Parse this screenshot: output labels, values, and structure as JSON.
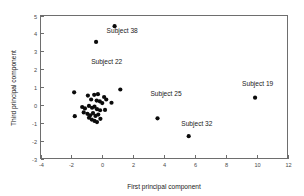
{
  "chart_data": {
    "type": "scatter",
    "title": "",
    "xlabel": "First principal component",
    "ylabel": "Third principal component",
    "xlim": [
      -4,
      12
    ],
    "ylim": [
      -3,
      5
    ],
    "xticks": [
      -4,
      -2,
      0,
      2,
      4,
      6,
      8,
      10,
      12
    ],
    "yticks": [
      -3,
      -2,
      -1,
      0,
      1,
      2,
      3,
      4,
      5
    ],
    "xtick_labels": [
      "-4",
      "-2",
      "0",
      "2",
      "4",
      "6",
      "8",
      "10",
      "12"
    ],
    "ytick_labels": [
      "-3",
      "-2",
      "-1",
      "0",
      "1",
      "2",
      "3",
      "4",
      "5"
    ],
    "grid": false,
    "legend": "none",
    "marker": "filled-circle",
    "marker_color": "#0b0b0b",
    "points": [
      {
        "x": 0.8,
        "y": 4.4
      },
      {
        "x": -0.4,
        "y": 3.52
      },
      {
        "x": 9.9,
        "y": 0.4
      },
      {
        "x": 3.58,
        "y": -0.75
      },
      {
        "x": 5.6,
        "y": -1.75
      },
      {
        "x": -1.82,
        "y": 0.7
      },
      {
        "x": 1.17,
        "y": 0.86
      },
      {
        "x": -0.93,
        "y": 0.52
      },
      {
        "x": -0.52,
        "y": 0.56
      },
      {
        "x": -0.28,
        "y": 0.6
      },
      {
        "x": 0.12,
        "y": 0.44
      },
      {
        "x": 0.26,
        "y": 0.3
      },
      {
        "x": 0.6,
        "y": 0.12
      },
      {
        "x": -0.72,
        "y": 0.3
      },
      {
        "x": -0.36,
        "y": 0.24
      },
      {
        "x": -0.16,
        "y": 0.2
      },
      {
        "x": 0.0,
        "y": 0.1
      },
      {
        "x": -1.3,
        "y": -0.12
      },
      {
        "x": -1.12,
        "y": -0.2
      },
      {
        "x": -0.86,
        "y": -0.06
      },
      {
        "x": -0.66,
        "y": -0.16
      },
      {
        "x": -0.5,
        "y": -0.1
      },
      {
        "x": -0.34,
        "y": -0.24
      },
      {
        "x": -0.14,
        "y": -0.3
      },
      {
        "x": 0.18,
        "y": -0.28
      },
      {
        "x": -1.78,
        "y": -0.63
      },
      {
        "x": -1.2,
        "y": -0.42
      },
      {
        "x": -0.96,
        "y": -0.5
      },
      {
        "x": -0.78,
        "y": -0.58
      },
      {
        "x": -0.6,
        "y": -0.46
      },
      {
        "x": -0.44,
        "y": -0.62
      },
      {
        "x": -0.26,
        "y": -0.54
      },
      {
        "x": -0.68,
        "y": -0.82
      },
      {
        "x": -0.5,
        "y": -0.9
      },
      {
        "x": -0.34,
        "y": -0.96
      },
      {
        "x": -0.12,
        "y": -0.78
      },
      {
        "x": -0.86,
        "y": -0.72
      }
    ],
    "annotations": [
      {
        "text": "Subject 38",
        "x": 0.28,
        "y": 4.02
      },
      {
        "text": "Subject 22",
        "x": -0.72,
        "y": 2.28
      },
      {
        "text": "Subject 19",
        "x": 9.06,
        "y": 1.04
      },
      {
        "text": "Subject 25",
        "x": 3.12,
        "y": 0.52
      },
      {
        "text": "Subject 32",
        "x": 5.12,
        "y": -1.2
      }
    ]
  }
}
